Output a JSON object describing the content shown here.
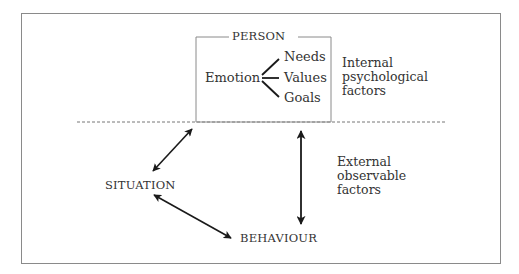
{
  "diagram": {
    "person": {
      "title": "PERSON",
      "center": "Emotion",
      "branches": [
        "Needs",
        "Values",
        "Goals"
      ]
    },
    "internal_label": {
      "lines": [
        "Internal",
        "psychological",
        "factors"
      ]
    },
    "external_label": {
      "lines": [
        "External",
        "observable",
        "factors"
      ]
    },
    "nodes": {
      "situation": "SITUATION",
      "behaviour": "BEHAVIOUR"
    },
    "divider": "dashed line separating internal psychological factors (above) from external observable factors (below)",
    "arrows": [
      {
        "from": "PERSON",
        "to": "SITUATION",
        "type": "bidirectional"
      },
      {
        "from": "SITUATION",
        "to": "BEHAVIOUR",
        "type": "bidirectional"
      },
      {
        "from": "PERSON",
        "to": "BEHAVIOUR",
        "type": "bidirectional"
      }
    ],
    "colors": {
      "frame": "#8a8a8a",
      "arrow": "#1a1a1a",
      "text": "#333333",
      "divider": "#777777"
    }
  }
}
